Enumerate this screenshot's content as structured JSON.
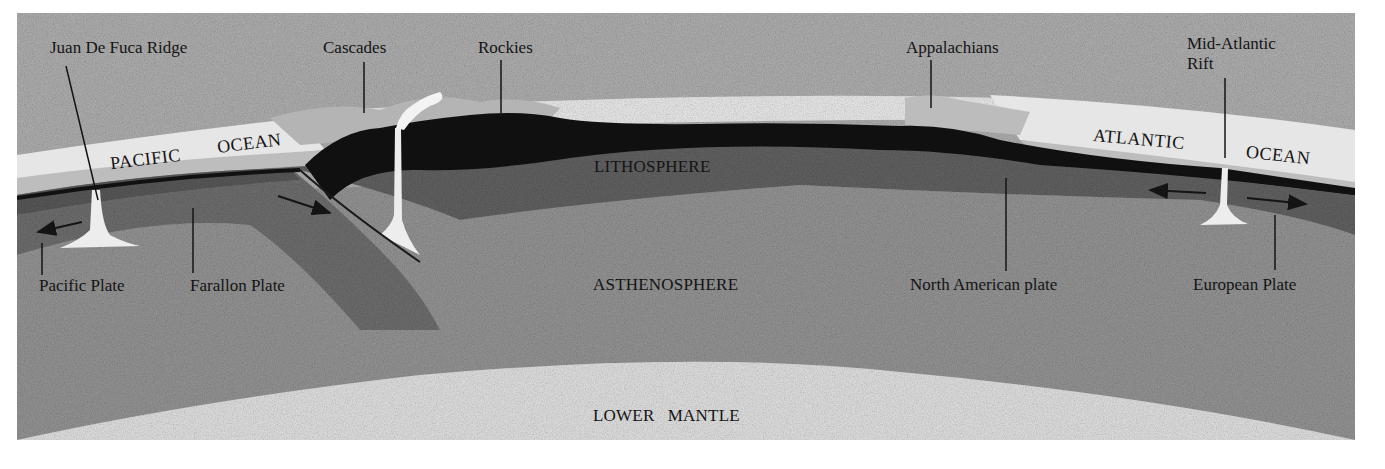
{
  "diagram": {
    "colors": {
      "background": "#ffffff",
      "sky": "#a9a9a9",
      "ocean": "#e6e6e6",
      "ocean_shelf": "#bdbdbd",
      "continental_crust": "#101010",
      "lithosphere": "#5e5e5e",
      "asthenosphere": "#8f8f8f",
      "lower_mantle": "#d9d9d9",
      "mountains": "#b4b4b4",
      "magma": "#ededed",
      "ink": "#141414"
    },
    "top_labels": {
      "juan_de_fuca_ridge": "Juan De Fuca Ridge",
      "cascades": "Cascades",
      "rockies": "Rockies",
      "appalachians": "Appalachians",
      "mid_atlantic_rift": "Mid-Atlantic\nRift"
    },
    "oceans": {
      "pacific_1": "PACIFIC",
      "pacific_2": "OCEAN",
      "atlantic_1": "ATLANTIC",
      "atlantic_2": "OCEAN"
    },
    "layers": {
      "lithosphere": "LITHOSPHERE",
      "asthenosphere": "ASTHENOSPHERE",
      "lower_mantle": "LOWER   MANTLE"
    },
    "plates": {
      "pacific": "Pacific Plate",
      "farallon": "Farallon Plate",
      "north_american": "North American plate",
      "european": "European Plate"
    },
    "arrows": [
      {
        "name": "pacific-plate-motion",
        "direction": "left"
      },
      {
        "name": "farallon-plate-motion",
        "direction": "down-right"
      },
      {
        "name": "atlantic-west-motion",
        "direction": "left"
      },
      {
        "name": "atlantic-east-motion",
        "direction": "right"
      }
    ]
  }
}
